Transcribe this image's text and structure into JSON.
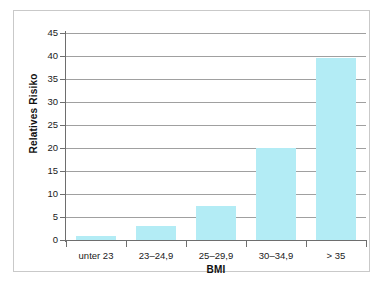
{
  "chart_data": {
    "type": "bar",
    "title": "",
    "xlabel": "BMI",
    "ylabel": "Relatives Risiko",
    "categories": [
      "unter 23",
      "23–24,9",
      "25–29,9",
      "30–34,9",
      "> 35"
    ],
    "values": [
      0.8,
      3.0,
      7.5,
      20.0,
      39.5
    ],
    "ylim": [
      0,
      45
    ],
    "ytick_labels": [
      "0",
      "5",
      "10",
      "15",
      "20",
      "25",
      "30",
      "35",
      "40",
      "45"
    ],
    "ytick_values": [
      0,
      5,
      10,
      15,
      20,
      25,
      30,
      35,
      40,
      45
    ],
    "grid": "horizontal",
    "legend": "none",
    "bar_color": "#b3ecf5",
    "axis_color": "#6e6e6e",
    "gridline_color": "#a0a0a0",
    "frame_color": "#c9c9c9",
    "background_color": "#ffffff",
    "text_color": "#1a1a1a"
  }
}
